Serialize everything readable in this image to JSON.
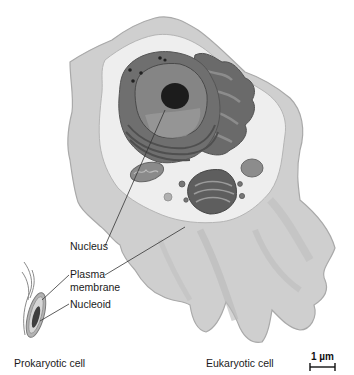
{
  "figure": {
    "labels": {
      "nucleus": "Nucleus",
      "plasma_membrane_line1": "Plasma",
      "plasma_membrane_line2": "membrane",
      "nucleoid": "Nucleoid"
    },
    "captions": {
      "prokaryotic": "Prokaryotic cell",
      "eukaryotic": "Eukaryotic cell"
    },
    "scale_bar": {
      "label": "1 µm"
    },
    "colors": {
      "cell_outer": "#c9c9c9",
      "cell_edge": "#a8a8a8",
      "cytoplasm": "#ebebeb",
      "er": "#6e6e6e",
      "nucleus": "#7a7a7a",
      "nucleolus": "#1c1c1c",
      "leader_line": "#333333"
    }
  }
}
